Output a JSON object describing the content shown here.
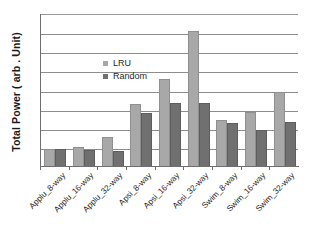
{
  "chart_data": {
    "type": "bar",
    "title": "",
    "subtitle": "",
    "xlabel": "",
    "ylabel": "Total Power ( arb . Unit)",
    "categories": [
      "Applu_8-way",
      "Applu_16-way",
      "Applu_32-way",
      "Apsi_8-way",
      "Apsi_16-way",
      "Apsi_32-way",
      "Swim_8-way",
      "Swim_16-way",
      "Swim_32-way"
    ],
    "series": [
      {
        "name": "LRU",
        "color": "#a8a8a8",
        "values": [
          0.95,
          1.05,
          1.55,
          3.3,
          4.6,
          7.1,
          2.45,
          2.9,
          3.9
        ]
      },
      {
        "name": "Random",
        "color": "#707070",
        "values": [
          0.95,
          0.9,
          0.85,
          2.8,
          3.35,
          3.35,
          2.3,
          1.95,
          2.35
        ]
      }
    ],
    "ylim": [
      0,
      8
    ],
    "yticks": [
      0,
      1,
      2,
      3,
      4,
      5,
      6,
      7,
      8
    ],
    "ytick_labels": [],
    "grid": true,
    "grid_axis": "y",
    "legend_position": "upper-left-inside",
    "axis_colors": {
      "frame": "#6e6e6e",
      "gridline": "#8d8d8d",
      "text": "#1f1f1f"
    }
  },
  "legend": {
    "entries": [
      {
        "label": "LRU"
      },
      {
        "label": "Random"
      }
    ]
  }
}
